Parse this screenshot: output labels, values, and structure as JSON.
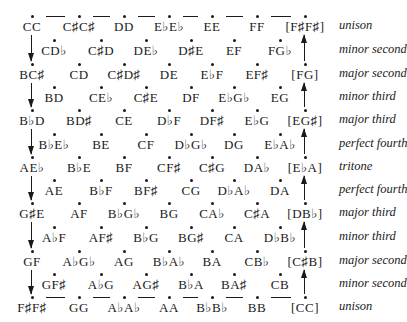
{
  "diagram": {
    "rows": [
      {
        "interval": "unison",
        "cells": [
          "CC",
          "C♯C♯",
          "DD",
          "E♭E♭",
          "EE",
          "FF",
          "[F♯F♯]"
        ]
      },
      {
        "interval": "minor second",
        "cells": [
          "CD♭",
          "C♯D",
          "DE♭",
          "D♯E",
          "EF",
          "FG♭"
        ]
      },
      {
        "interval": "major second",
        "cells": [
          "BC♯",
          "CD",
          "C♯D♯",
          "DE",
          "E♭F",
          "EF♯",
          "[FG]"
        ]
      },
      {
        "interval": "minor third",
        "cells": [
          "BD",
          "CE♭",
          "C♯E",
          "DF",
          "E♭G♭",
          "EG"
        ]
      },
      {
        "interval": "major third",
        "cells": [
          "B♭D",
          "BD♯",
          "CE",
          "D♭F",
          "DF♯",
          "E♭G",
          "[EG♯]"
        ]
      },
      {
        "interval": "perfect fourth",
        "cells": [
          "B♭E♭",
          "BE",
          "CF",
          "D♭G♭",
          "DG",
          "E♭A♭"
        ]
      },
      {
        "interval": "tritone",
        "cells": [
          "AE♭",
          "B♭E",
          "BF",
          "CF♯",
          "C♯G",
          "DA♭",
          "[E♭A]"
        ]
      },
      {
        "interval": "perfect fourth",
        "cells": [
          "AE",
          "B♭F",
          "BF♯",
          "CG",
          "D♭A♭",
          "DA"
        ]
      },
      {
        "interval": "major third",
        "cells": [
          "G♯E",
          "AF",
          "B♭G♭",
          "BG",
          "CA♭",
          "C♯A",
          "[DB♭]"
        ]
      },
      {
        "interval": "minor third",
        "cells": [
          "A♭F",
          "AF♯",
          "B♭G",
          "BG♯",
          "CA",
          "D♭B♭"
        ]
      },
      {
        "interval": "major second",
        "cells": [
          "GF",
          "A♭G♭",
          "AG",
          "B♭A♭",
          "BA",
          "CB♭",
          "[C♯B]"
        ]
      },
      {
        "interval": "minor second",
        "cells": [
          "GF♯",
          "A♭G",
          "AG♯",
          "B♭A",
          "BA♯",
          "CB"
        ]
      },
      {
        "interval": "unison",
        "cells": [
          "F♯F♯",
          "GG",
          "A♭A♭",
          "AA",
          "B♭B♭",
          "BB",
          "[CC]"
        ]
      }
    ]
  }
}
